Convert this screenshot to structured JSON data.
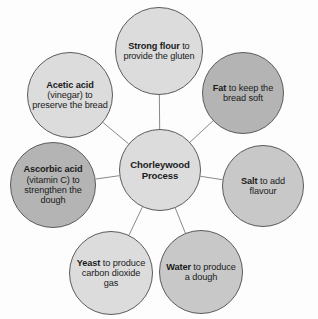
{
  "diagram": {
    "title": "Chorleywood Process",
    "type": "radial-hub-and-spoke",
    "background_color": "#fdfdfd",
    "edge_color": "#8a8a8a",
    "outline_color": "#5b5b5b",
    "text_color": "#1b1b1b",
    "center": {
      "id": "center",
      "name_bold": "Chorleywood",
      "description": "Process",
      "full_text": "Chorleywood Process",
      "fill_color": "#dcdcdc",
      "cx": 160,
      "cy": 170,
      "r": 41,
      "font_size": 9.6
    },
    "nodes": [
      {
        "id": "strong-flour",
        "name_bold": "Strong flour",
        "description": "to provide the gluten",
        "full_text": "Strong flour to provide the gluten",
        "fill_color": "#dcdcdc",
        "cx": 159,
        "cy": 51,
        "r": 44,
        "font_size": 9.2
      },
      {
        "id": "fat",
        "name_bold": "Fat",
        "description": "to keep the bread soft",
        "full_text": "Fat to keep the bread soft",
        "fill_color": "#b4b4b4",
        "cx": 243,
        "cy": 93,
        "r": 41,
        "font_size": 9.2
      },
      {
        "id": "salt",
        "name_bold": "Salt",
        "description": "to add flavour",
        "full_text": "Salt to add flavour",
        "fill_color": "#c8c8c8",
        "cx": 263,
        "cy": 186,
        "r": 41,
        "font_size": 9.2
      },
      {
        "id": "water",
        "name_bold": "Water",
        "description": "to produce a dough",
        "full_text": "Water to produce a dough",
        "fill_color": "#c8c8c8",
        "cx": 201,
        "cy": 272,
        "r": 42,
        "font_size": 9.2
      },
      {
        "id": "yeast",
        "name_bold": "Yeast",
        "description": "to produce carbon dioxide gas",
        "full_text": "Yeast to produce carbon dioxide gas",
        "fill_color": "#dcdcdc",
        "cx": 111,
        "cy": 273,
        "r": 42,
        "font_size": 9.2
      },
      {
        "id": "ascorbic-acid",
        "name_bold": "Ascorbic acid",
        "description": "(vitamin C) to strengthen the dough",
        "full_text": "Ascorbic acid (vitamin C) to strengthen the dough",
        "fill_color": "#b4b4b4",
        "cx": 53,
        "cy": 185,
        "r": 43,
        "font_size": 9.2
      },
      {
        "id": "acetic-acid",
        "name_bold": "Acetic acid",
        "description": "(vinegar) to preserve the bread",
        "full_text": "Acetic acid (vinegar) to preserve the bread",
        "fill_color": "#dcdcdc",
        "cx": 70,
        "cy": 95,
        "r": 43,
        "font_size": 9.2
      }
    ],
    "edges": [
      {
        "id": "edge-center-strong-flour",
        "from": "center",
        "to": "strong-flour"
      },
      {
        "id": "edge-center-fat",
        "from": "center",
        "to": "fat"
      },
      {
        "id": "edge-center-salt",
        "from": "center",
        "to": "salt"
      },
      {
        "id": "edge-center-water",
        "from": "center",
        "to": "water"
      },
      {
        "id": "edge-center-yeast",
        "from": "center",
        "to": "yeast"
      },
      {
        "id": "edge-center-ascorbic-acid",
        "from": "center",
        "to": "ascorbic-acid"
      },
      {
        "id": "edge-center-acetic-acid",
        "from": "center",
        "to": "acetic-acid"
      }
    ]
  }
}
